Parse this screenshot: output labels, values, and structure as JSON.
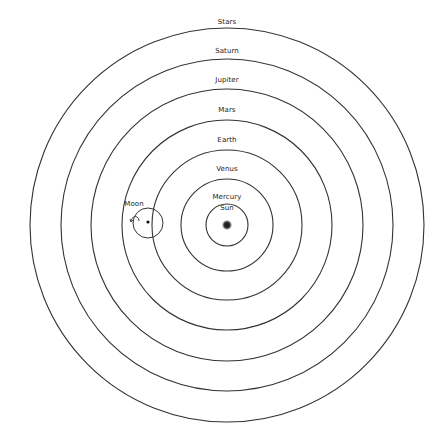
{
  "diagram": {
    "center": {
      "x": 227,
      "y": 225
    },
    "stroke_color": "#333333",
    "orbits": [
      {
        "name": "Stars",
        "radius": 197,
        "label_y": 19
      },
      {
        "name": "Saturn",
        "radius": 166,
        "label_y": 48
      },
      {
        "name": "Jupiter",
        "radius": 136,
        "label_y": 77
      },
      {
        "name": "Mars",
        "radius": 105,
        "label_y": 107
      },
      {
        "name": "Earth",
        "radius": 75,
        "label_y": 137
      },
      {
        "name": "Venus",
        "radius": 46,
        "label_y": 166
      },
      {
        "name": "Mercury",
        "radius": 21,
        "label_y": 194
      }
    ],
    "sun": {
      "label": "Sun",
      "label_y": 205,
      "radius": 5,
      "color": "#222222"
    },
    "moon": {
      "label": "Moon",
      "label_x": 134,
      "label_y": 201,
      "epicycle_cx": 148,
      "epicycle_cy": 223,
      "epicycle_r": 15
    }
  }
}
